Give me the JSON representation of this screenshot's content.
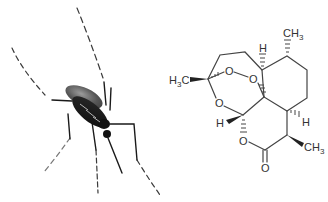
{
  "figure": {
    "left_image": {
      "subject": "mosquito",
      "icon": "mosquito-photo"
    },
    "right_image": {
      "subject": "artemisinin chemical structure",
      "icon": "molecule-structure",
      "labels": {
        "ch3_top": "CH",
        "ch3_top_sub": "3",
        "h3c_left": "H",
        "h3c_left_sub": "3",
        "h3c_left_c": "C",
        "h_top": "H",
        "o_peroxide_1": "O",
        "o_peroxide_2": "O",
        "o_ring": "O",
        "h_acetal": "H",
        "h_right": "H",
        "o_lactone": "O",
        "o_carbonyl": "O",
        "ch3_right": "CH",
        "ch3_right_sub": "3"
      }
    }
  }
}
